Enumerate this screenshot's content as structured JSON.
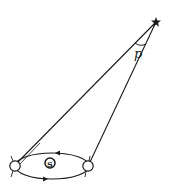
{
  "diagram": {
    "type": "stellar-parallax",
    "colors": {
      "ink": "#1a1a1a",
      "background": "#ffffff"
    },
    "labels": {
      "parallax_angle": "p",
      "sun": "S"
    },
    "elements": {
      "star": {
        "x": 156,
        "y": 22
      },
      "earth_left": {
        "x": 15,
        "y": 166,
        "r": 5
      },
      "earth_right": {
        "x": 88,
        "y": 166,
        "r": 5
      },
      "sun": {
        "x": 50,
        "y": 163
      },
      "orbit": {
        "cx": 52,
        "cy": 166,
        "rx": 37,
        "ry": 13
      }
    }
  }
}
